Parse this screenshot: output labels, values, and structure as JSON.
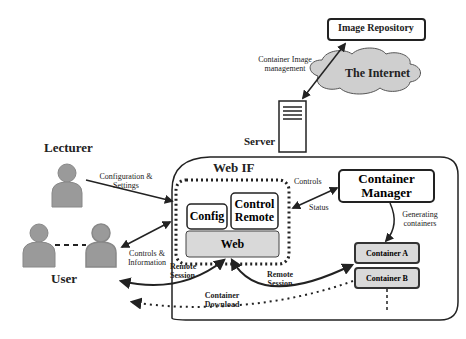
{
  "diagram": {
    "nodes": {
      "image_repository": "Image Repository",
      "internet": "The Internet",
      "server": "Server",
      "lecturer": "Lecturer",
      "user": "User",
      "web_if": "Web IF",
      "config": "Config",
      "control_remote": "Control Remote",
      "web": "Web",
      "container_manager": "Container Manager",
      "container_a": "Container A",
      "container_b": "Container B"
    },
    "edges": {
      "container_image_management": "Container Image management",
      "configuration_settings": "Configuration & Settings",
      "controls_information": "Controls & Information",
      "controls": "Controls",
      "status": "Status",
      "generating_containers": "Generating containers",
      "remote_session_1": "Remote Session",
      "remote_session_2": "Remote Session",
      "container_download": "Container Download"
    },
    "colors": {
      "person_fill": "#9a9a9a",
      "box_fill": "#d9d9d9",
      "cloud_fill": "#cfcfcf",
      "stroke": "#222222"
    }
  }
}
